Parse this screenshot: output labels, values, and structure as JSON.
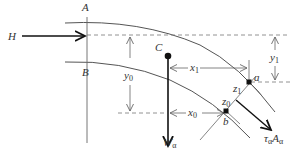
{
  "diagram": {
    "type": "free-body diagram of a curved flow section",
    "colors": {
      "line": "#555555",
      "thick": "#111111",
      "dashed": "#777777",
      "text": "#333333"
    },
    "labels": {
      "A": "A",
      "B": "B",
      "H": "H",
      "C": "C",
      "y0_main": "y",
      "y0_sub": "0",
      "x1_main": "x",
      "x1_sub": "1",
      "x0_main": "x",
      "x0_sub": "0",
      "y1_main": "y",
      "y1_sub": "1",
      "z1_main": "z",
      "z1_sub": "1",
      "z0_main": "z",
      "z0_sub": "0",
      "a": "a",
      "b": "b",
      "W_main": "W",
      "W_sub": "α",
      "tau_main": "τ",
      "tau_sub": "α",
      "A_main": "A",
      "A_sub": "α"
    },
    "elements": [
      "section line AB",
      "upper boundary curve",
      "lower boundary curve",
      "horizontal force H",
      "centroid C",
      "weight W_alpha",
      "shear force tau_alpha A_alpha",
      "point a",
      "point b",
      "dimension x1",
      "dimension x0",
      "dimension y0",
      "dimension y1",
      "depth z1",
      "depth z0"
    ]
  }
}
